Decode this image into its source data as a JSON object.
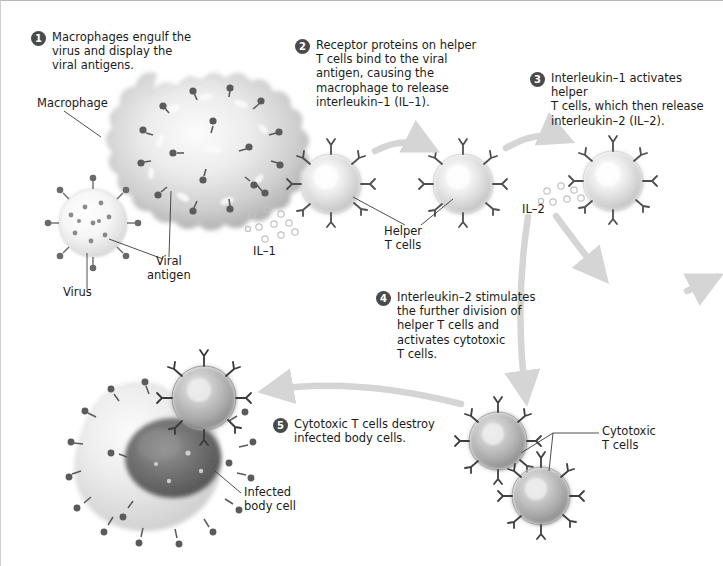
{
  "diagram": {
    "accent_color": "#4a4a4a",
    "arrow_color": "#d5d5d5",
    "leader_color": "#3a3a3a"
  },
  "steps": [
    {
      "number": "1",
      "text": "Macrophages engulf the\nvirus and display the\nviral antigens."
    },
    {
      "number": "2",
      "text": "Receptor proteins on helper\nT cells bind to the viral\nantigen, causing the\nmacrophage to release\ninterleukin–1 (IL–1)."
    },
    {
      "number": "3",
      "text": "Interleukin–1 activates helper\nT cells, which then release\ninterleukin–2 (IL–2)."
    },
    {
      "number": "4",
      "text": "Interleukin–2 stimulates\nthe further division of\nhelper T cells and\nactivates cytotoxic\nT cells."
    },
    {
      "number": "5",
      "text": "Cytotoxic T cells destroy\ninfected body cells."
    }
  ],
  "labels": {
    "macrophage": "Macrophage",
    "virus": "Virus",
    "viral_antigen": "Viral\nantigen",
    "il1": "IL–1",
    "il2": "IL–2",
    "helper_t_cells": "Helper\nT cells",
    "cytotoxic_t_cells": "Cytotoxic\nT cells",
    "infected_body_cell": "Infected\nbody cell"
  }
}
